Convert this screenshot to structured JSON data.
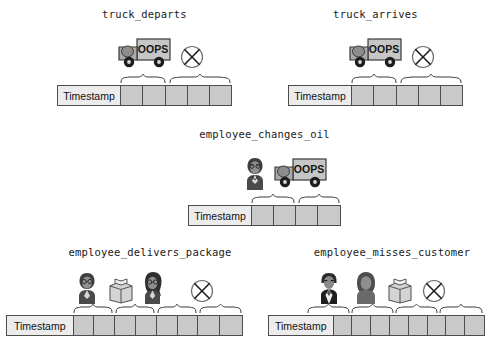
{
  "diagram": {
    "title_font_style": "monospace",
    "cell_color": "#c9c9c9",
    "timestamp_cell_color": "#ececec",
    "border_color": "#4d4d4d",
    "timestamp_label": "Timestamp",
    "truck_text": "OOPS"
  },
  "panels": [
    {
      "id": "truck-departs",
      "title": "truck_departs",
      "timestamp_label": "Timestamp",
      "cell_count": 5,
      "icons": [
        "truck-icon",
        "crossed-circle-icon"
      ],
      "braces": [
        {
          "span": 2,
          "start": 0
        },
        {
          "span": 3,
          "start": 2
        }
      ]
    },
    {
      "id": "truck-arrives",
      "title": "truck_arrives",
      "timestamp_label": "Timestamp",
      "cell_count": 5,
      "icons": [
        "truck-icon",
        "crossed-circle-icon"
      ],
      "braces": [
        {
          "span": 2,
          "start": 0
        },
        {
          "span": 3,
          "start": 2
        }
      ]
    },
    {
      "id": "employee-changes-oil",
      "title": "employee_changes_oil",
      "timestamp_label": "Timestamp",
      "cell_count": 4,
      "icons": [
        "employee-icon",
        "truck-icon"
      ],
      "braces": [
        {
          "span": 2,
          "start": 0
        },
        {
          "span": 2,
          "start": 2
        }
      ]
    },
    {
      "id": "employee-delivers-package",
      "title": "employee_delivers_package",
      "timestamp_label": "Timestamp",
      "cell_count": 8,
      "icons": [
        "employee-icon",
        "package-icon",
        "customer-icon",
        "crossed-circle-icon"
      ],
      "braces": [
        {
          "span": 2,
          "start": 0
        },
        {
          "span": 2,
          "start": 2
        },
        {
          "span": 2,
          "start": 4
        },
        {
          "span": 2,
          "start": 6
        }
      ]
    },
    {
      "id": "employee-misses-customer",
      "title": "employee_misses_customer",
      "timestamp_label": "Timestamp",
      "cell_count": 8,
      "icons": [
        "employee-male-icon",
        "customer-icon",
        "package-icon",
        "crossed-circle-icon"
      ],
      "braces": [
        {
          "span": 2,
          "start": 0
        },
        {
          "span": 2,
          "start": 2
        },
        {
          "span": 2,
          "start": 4
        },
        {
          "span": 2,
          "start": 6
        }
      ]
    }
  ]
}
